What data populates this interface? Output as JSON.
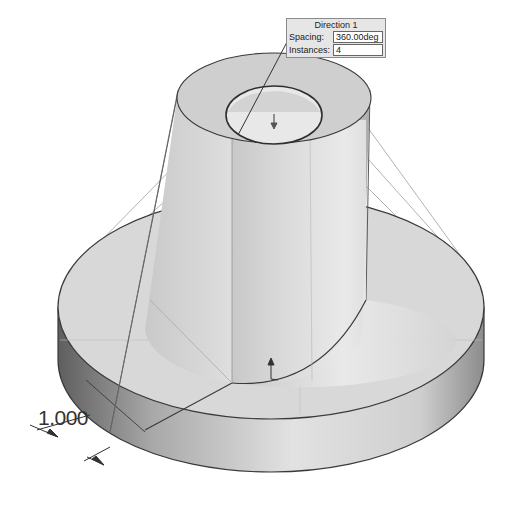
{
  "viewport": {
    "background": "#ffffff",
    "model": "revolved-flange-with-tapered-boss"
  },
  "pattern_callout": {
    "title": "Direction 1",
    "spacing_label": "Spacing:",
    "spacing_value": "360.00deg",
    "instances_label": "Instances:",
    "instances_value": "4"
  },
  "dimension": {
    "value": "1.000"
  },
  "colors": {
    "edge": "#3a3a3a",
    "face_light": "#e4e4e4",
    "face_mid": "#cfcfcf",
    "face_dark": "#8a8a8a",
    "preview_line": "#9a9a9a"
  }
}
